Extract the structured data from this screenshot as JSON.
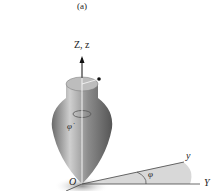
{
  "figure": {
    "caption": "(a)",
    "labels": {
      "z_axis": "Z, z",
      "origin": "O",
      "phi_dot": "φ̇",
      "phi": "φ",
      "y_rot": "y",
      "Y_fixed": "Y"
    }
  }
}
